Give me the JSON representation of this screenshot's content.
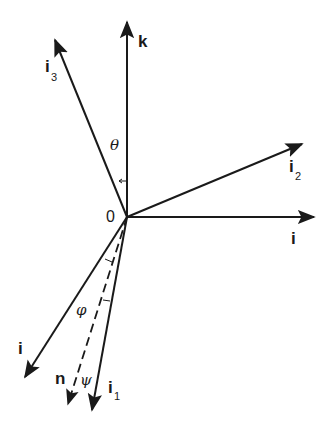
{
  "diagram": {
    "type": "vector-coordinate-frame",
    "origin": {
      "label": "0",
      "x": 127,
      "y": 217
    },
    "colors": {
      "stroke": "#1a1a1a",
      "background": "#ffffff"
    },
    "vectors": [
      {
        "id": "k",
        "label": "k",
        "subscript": "",
        "x2": 127,
        "y2": 22,
        "style": "solid"
      },
      {
        "id": "i3",
        "label": "i",
        "subscript": "3",
        "x2": 55,
        "y2": 40,
        "style": "solid"
      },
      {
        "id": "i2",
        "label": "i",
        "subscript": "2",
        "x2": 302,
        "y2": 144,
        "style": "solid"
      },
      {
        "id": "i-right",
        "label": "i",
        "subscript": "",
        "x2": 314,
        "y2": 217,
        "style": "solid"
      },
      {
        "id": "i-lower",
        "label": "i",
        "subscript": "",
        "x2": 25,
        "y2": 377,
        "style": "solid"
      },
      {
        "id": "n",
        "label": "n",
        "subscript": "",
        "x2": 68,
        "y2": 404,
        "style": "dashed"
      },
      {
        "id": "i1",
        "label": "i",
        "subscript": "1",
        "x2": 92,
        "y2": 410,
        "style": "solid"
      }
    ],
    "angles": [
      {
        "id": "theta",
        "symbol": "θ",
        "between": [
          "k",
          "i3"
        ]
      },
      {
        "id": "phi",
        "symbol": "φ",
        "between": [
          "i-lower",
          "n"
        ]
      },
      {
        "id": "psi",
        "symbol": "ψ",
        "between": [
          "n",
          "i1"
        ]
      }
    ]
  }
}
